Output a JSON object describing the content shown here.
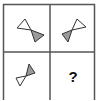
{
  "puzzle": {
    "type": "2x2 matrix puzzle",
    "colors": {
      "grid": "#555555",
      "outline": "#333333",
      "fill_white": "#ffffff",
      "fill_gray": "#9a9a9a"
    },
    "cells": [
      {
        "position": "top-left",
        "content": "bow-tie: white triangle upper-left, gray triangle lower-right"
      },
      {
        "position": "top-right",
        "content": "bow-tie: white triangle upper-right, gray triangle lower-left"
      },
      {
        "position": "bottom-left",
        "content": "bow-tie: gray triangle upper-right, white triangle lower-left"
      },
      {
        "position": "bottom-right",
        "content": "unknown",
        "label": "?"
      }
    ]
  }
}
